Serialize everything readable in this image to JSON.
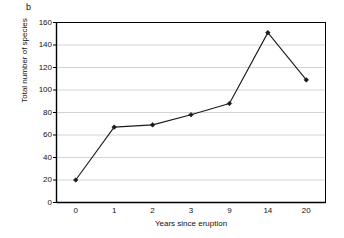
{
  "figure": {
    "panel_label": "b",
    "background_color": "#ffffff",
    "axis_color": "#000000",
    "gridline_color": "#c8c8c8",
    "series_color": "#1a1a1a"
  },
  "chart_data": {
    "type": "line",
    "title": "",
    "panel": "b",
    "xlabel": "Years since eruption",
    "ylabel": "Total number of species",
    "categories": [
      "0",
      "1",
      "2",
      "3",
      "9",
      "14",
      "20"
    ],
    "values": [
      20,
      67,
      69,
      78,
      88,
      151,
      109
    ],
    "series": [
      {
        "name": "Total number of species",
        "values": [
          20,
          67,
          69,
          78,
          88,
          151,
          109
        ],
        "marker": "filled-diamond",
        "color": "#1a1a1a"
      }
    ],
    "ylim": [
      0,
      160
    ],
    "ytick_labels": [
      "0",
      "20",
      "40",
      "60",
      "80",
      "100",
      "120",
      "140",
      "160"
    ],
    "ytick_values": [
      0,
      20,
      40,
      60,
      80,
      100,
      120,
      140,
      160
    ],
    "grid": "horizontal",
    "legend": "none",
    "xaxis_scale": "categorical"
  }
}
